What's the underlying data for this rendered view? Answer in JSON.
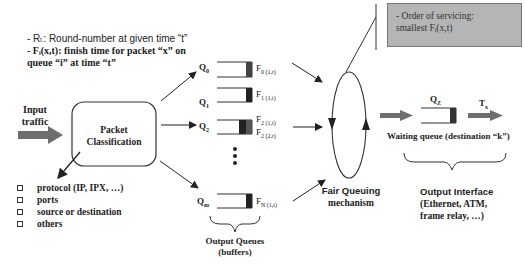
{
  "legend": {
    "line1": "- Rₜ: Round-number at given time “t”",
    "line2": "- Fᵢ(x,t): finish time for packet “x” on",
    "line3": "queue “i” at time “t”"
  },
  "note": {
    "line1": "- Order of servicing:",
    "line2": "smallest Fᵢ(x,t)"
  },
  "input": {
    "label_line1": "Input",
    "label_line2": "traffic"
  },
  "classifier": {
    "label_line1": "Packet",
    "label_line2": "Classification"
  },
  "classification_criteria": [
    "protocol (IP, IPX, …)",
    "ports",
    "source or destination",
    "others"
  ],
  "queues": [
    {
      "name": "Q",
      "sub": "0",
      "finish": "F",
      "finish_sub": "0 (1,t)"
    },
    {
      "name": "Q",
      "sub": "1",
      "finish": "F",
      "finish_sub": "1 (1,t)"
    },
    {
      "name": "Q",
      "sub": "2",
      "finish": "F",
      "finish_sub": "2 (1,t)",
      "finish2": "F",
      "finish2_sub": "2 (2,t)"
    },
    {
      "name": "Q",
      "sub": "m",
      "finish": "F",
      "finish_sub": "N (1,t)"
    }
  ],
  "output_queues": {
    "line1": "Output Queues",
    "line2": "(buffers)"
  },
  "fair_queuing": {
    "line1": "Fair Queuing",
    "line2": "mechanism"
  },
  "waiting_queue": {
    "name": "Q",
    "sub": "Z",
    "tx": "T",
    "tx_sub": "x",
    "label": "Waiting queue (destination “k”)"
  },
  "output_interface": {
    "line1": "Output Interface",
    "line2": "(Ethernet, ATM,",
    "line3": "frame relay, …)"
  },
  "colors": {
    "note_bg": "#b5b5b5",
    "arrow_fill": "#6e6e6e",
    "packet": "#333333"
  }
}
